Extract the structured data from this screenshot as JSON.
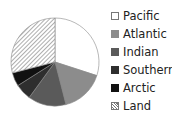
{
  "chart_data": {
    "type": "pie",
    "title": "",
    "categories": [
      "Pacific",
      "Atlantic",
      "Indian",
      "Southern",
      "Arctic",
      "Land"
    ],
    "values": [
      30,
      16,
      14,
      6,
      5,
      29
    ],
    "unit": "percent (estimated)",
    "colors": [
      "#ffffff",
      "#8c8c8c",
      "#5a5a5a",
      "#2e2e2e",
      "#111111",
      "hatch"
    ],
    "start_angle": "12 o'clock",
    "direction": "clockwise",
    "legend_position": "right"
  },
  "legend": {
    "items": [
      {
        "label": "Pacific",
        "color": "#ffffff"
      },
      {
        "label": "Atlantic",
        "color": "#8c8c8c"
      },
      {
        "label": "Indian",
        "color": "#5a5a5a"
      },
      {
        "label": "Southern",
        "color": "#2e2e2e"
      },
      {
        "label": "Arctic",
        "color": "#111111"
      },
      {
        "label": "Land",
        "color": "hatch"
      }
    ]
  }
}
